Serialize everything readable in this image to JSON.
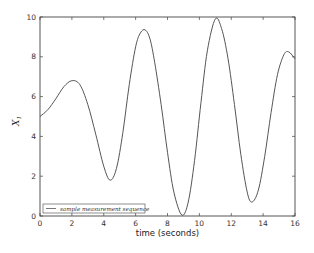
{
  "chart_data": {
    "type": "line",
    "title": "",
    "xlabel": "time (seconds)",
    "ylabel": "X_1",
    "ylabel_display": "X",
    "ylabel_sub": "1",
    "xlim": [
      0,
      16
    ],
    "ylim": [
      0,
      10
    ],
    "x_ticks": [
      "0",
      "2",
      "4",
      "6",
      "8",
      "10",
      "12",
      "14",
      "16"
    ],
    "y_ticks": [
      "0",
      "2",
      "4",
      "6",
      "8",
      "10"
    ],
    "grid": false,
    "legend": {
      "position": "lower left",
      "entries": [
        "sample measurement sequence"
      ]
    },
    "series": [
      {
        "name": "sample measurement sequence",
        "color": "#555555",
        "x": [
          0,
          0.5,
          1.0,
          1.5,
          2.0,
          2.5,
          3.0,
          3.5,
          4.0,
          4.4,
          4.8,
          5.2,
          5.6,
          6.0,
          6.3,
          6.6,
          6.9,
          7.2,
          7.6,
          8.0,
          8.4,
          8.9,
          9.3,
          9.7,
          10.1,
          10.5,
          11.0,
          11.4,
          11.8,
          12.2,
          12.6,
          13.0,
          13.3,
          13.7,
          14.1,
          14.5,
          14.9,
          15.3,
          15.6,
          16.0
        ],
        "values": [
          5.0,
          5.35,
          5.9,
          6.5,
          6.8,
          6.6,
          5.6,
          4.1,
          2.5,
          1.8,
          2.4,
          4.2,
          6.6,
          8.5,
          9.2,
          9.35,
          8.9,
          7.7,
          5.6,
          3.2,
          1.2,
          0.05,
          0.7,
          2.8,
          5.7,
          8.3,
          9.9,
          9.4,
          7.9,
          5.6,
          3.1,
          1.2,
          0.7,
          1.3,
          3.0,
          5.2,
          7.1,
          8.1,
          8.25,
          7.9
        ]
      }
    ]
  }
}
